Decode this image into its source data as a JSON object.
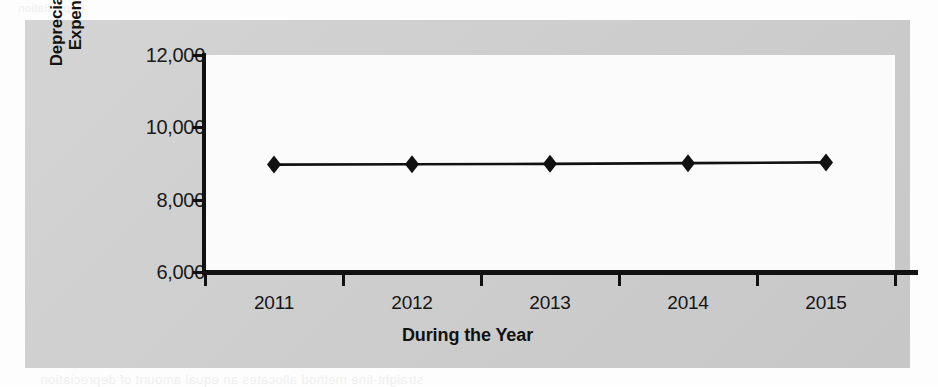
{
  "page": {
    "background_color": "#fdfdfd",
    "figure_background_color": "#cfcfcf",
    "plot_background_color": "#fbfbfb",
    "ink_color": "#111111",
    "bleed_through_text": {
      "top": "Depreciation",
      "line1": "declines, the cost of the asset is charged as an expense and",
      "line2": "used and benefits are received. The matching principle",
      "line3": "acquires a machine for $50,000. Morgan expects the machine",
      "line4": "life. Morgan must match the cost of the machine to the",
      "bottom": "straight-line method allocates an equal amount of depreciation"
    }
  },
  "chart_data": {
    "type": "line",
    "title": "",
    "xlabel": "During the Year",
    "ylabel": "Depreciation Expense",
    "ylabel_lines": [
      "Depreciation",
      "Expense"
    ],
    "categories": [
      "2011",
      "2012",
      "2013",
      "2014",
      "2015"
    ],
    "values": [
      8970,
      8980,
      8990,
      9010,
      9030
    ],
    "series": [
      {
        "name": "Depreciation Expense",
        "values": [
          8970,
          8980,
          8990,
          9010,
          9030
        ],
        "marker": "diamond",
        "marker_color": "#111111",
        "line_color": "#111111"
      }
    ],
    "ylim": [
      6000,
      12000
    ],
    "yticks": [
      12000,
      10000,
      8000,
      6000
    ],
    "ytick_labels": [
      "12,000",
      "10,000",
      "8,000",
      "6,000"
    ],
    "xtick_labels": [
      "2011",
      "2012",
      "2013",
      "2014",
      "2015"
    ],
    "grid": false,
    "legend": false,
    "legend_position": "none"
  }
}
